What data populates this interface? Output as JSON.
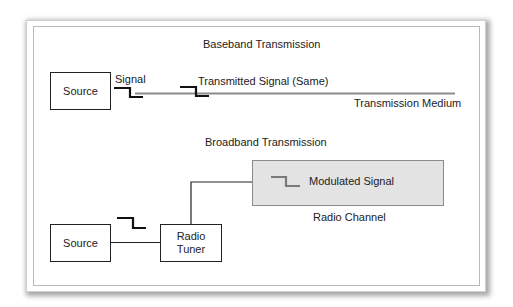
{
  "baseband": {
    "title": "Baseband Transmission",
    "source_label": "Source",
    "signal_label": "Signal",
    "transmitted_label": "Transmitted Signal (Same)",
    "medium_label": "Transmission Medium"
  },
  "broadband": {
    "title": "Broadband Transmission",
    "source_label": "Source",
    "tuner_label_line1": "Radio",
    "tuner_label_line2": "Tuner",
    "modulated_label": "Modulated Signal",
    "channel_label": "Radio Channel"
  },
  "icons": {
    "signal_step": "square-wave-step-icon",
    "modulated_step": "modulated-step-icon"
  },
  "colors": {
    "line": "#222222",
    "medium": "#8c8c8c",
    "channel_fill": "#e3e3e3",
    "modulated_step": "#7a7a7a"
  }
}
